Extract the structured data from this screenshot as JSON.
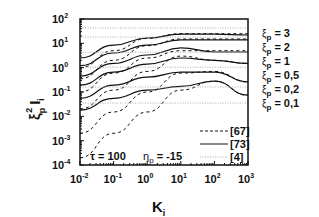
{
  "chart_data": {
    "type": "line",
    "title": "",
    "xlabel": "K_i",
    "ylabel": "ξ_p^2 I_i",
    "xscale": "log",
    "yscale": "log",
    "xlim": [
      0.01,
      1000
    ],
    "ylim": [
      0.0001,
      100
    ],
    "x_ticks": [
      "10^-2",
      "10^-1",
      "10^0",
      "10^1",
      "10^2",
      "10^3"
    ],
    "y_ticks": [
      "10^-4",
      "10^-3",
      "10^-2",
      "10^-1",
      "10^0",
      "10^1",
      "10^2"
    ],
    "grid": false,
    "legend": {
      "position": "lower right",
      "entries": [
        {
          "label": "[67]",
          "style": "dashed"
        },
        {
          "label": "[73]",
          "style": "solid"
        },
        {
          "label": "[4]",
          "style": "dotted-light"
        }
      ]
    },
    "annotations": [
      "τ = 100",
      "η_p = -15"
    ],
    "series_labels": [
      "ξ_p = 3",
      "ξ_p = 2",
      "ξ_p = 1",
      "ξ_p = 0,5",
      "ξ_p = 0,2",
      "ξ_p = 0,1"
    ],
    "x": [
      0.01,
      0.1,
      1,
      10,
      100,
      1000
    ],
    "series": [
      {
        "name": "ξp=3 [73]",
        "style": "solid",
        "values": [
          2.5,
          8.5,
          16.5,
          24,
          24,
          22
        ]
      },
      {
        "name": "ξp=2 [73]",
        "style": "solid",
        "values": [
          1.2,
          4.0,
          8.5,
          14,
          14,
          14
        ]
      },
      {
        "name": "ξp=1 [73]",
        "style": "solid",
        "values": [
          0.45,
          1.5,
          3.3,
          6.5,
          4.4,
          4.4
        ]
      },
      {
        "name": "ξp=0,5 [73]",
        "style": "solid",
        "values": [
          0.19,
          0.66,
          1.4,
          2.5,
          2.0,
          1.5
        ]
      },
      {
        "name": "ξp=0,2 [73]",
        "style": "solid",
        "values": [
          0.055,
          0.19,
          0.41,
          0.66,
          0.66,
          0.26
        ]
      },
      {
        "name": "ξp=0,1 [73]",
        "style": "solid",
        "values": [
          0.018,
          0.055,
          0.12,
          0.17,
          0.28,
          0.074
        ]
      },
      {
        "name": "ξp=3 [67]",
        "style": "dashed",
        "values": [
          1.0,
          5.0,
          16,
          25,
          25,
          25
        ]
      },
      {
        "name": "ξp=2 [67]",
        "style": "dashed",
        "values": [
          0.35,
          2.0,
          8.0,
          15,
          15,
          15
        ]
      },
      {
        "name": "ξp=1 [67]",
        "style": "dashed",
        "values": [
          0.1,
          0.6,
          2.5,
          5.0,
          5.0,
          5.0
        ]
      },
      {
        "name": "ξp=0,5 [67]",
        "style": "dashed",
        "values": [
          0.02,
          0.12,
          0.7,
          3.0,
          2.0,
          1.5
        ]
      },
      {
        "name": "ξp=0,2 [67]",
        "style": "dashed",
        "values": [
          0.002,
          0.015,
          0.1,
          0.6,
          0.7,
          0.26
        ]
      },
      {
        "name": "ξp=0,1 [67]",
        "style": "dashed",
        "values": [
          0.0002,
          0.002,
          0.015,
          0.12,
          0.28,
          0.074
        ]
      },
      {
        "name": "ξp=3 [4]",
        "style": "dotted-light",
        "values": [
          43,
          43,
          43,
          43,
          43,
          43
        ]
      },
      {
        "name": "ξp=2 [4]",
        "style": "dotted-light",
        "values": [
          18,
          18,
          18,
          18,
          18,
          18
        ]
      },
      {
        "name": "ξp=1 [4]",
        "style": "dotted-light",
        "values": [
          4.3,
          4.3,
          4.3,
          4.3,
          4.3,
          4.3
        ]
      },
      {
        "name": "ξp=0,5 [4]",
        "style": "dotted-light",
        "values": [
          1.05,
          1.05,
          1.05,
          1.05,
          1.05,
          1.05
        ]
      },
      {
        "name": "ξp=0,2 [4]",
        "style": "dotted-light",
        "values": [
          0.16,
          0.16,
          0.16,
          0.16,
          0.16,
          0.16
        ]
      },
      {
        "name": "ξp=0,1 [4]",
        "style": "dotted-light",
        "values": [
          0.035,
          0.035,
          0.035,
          0.035,
          0.035,
          0.035
        ]
      }
    ]
  },
  "labels": {
    "ylabel_main": "ξ",
    "ylabel_sub": "p",
    "ylabel_sup": "2",
    "ylabel_I": "I",
    "ylabel_i": "i",
    "xlabel_main": "K",
    "xlabel_sub": "i",
    "tau": "τ = 100",
    "eta_main": "η",
    "eta_sub": "p",
    "eta_val": " = -15",
    "legend": [
      "[67]",
      "[73]",
      "[4]"
    ],
    "xi_labels": [
      "= 3",
      "= 2",
      "= 1",
      "= 0,5",
      "= 0,2",
      "= 0,1"
    ]
  },
  "colors": {
    "line": "#111111",
    "light": "#aaaaaa",
    "background": "#ffffff"
  }
}
